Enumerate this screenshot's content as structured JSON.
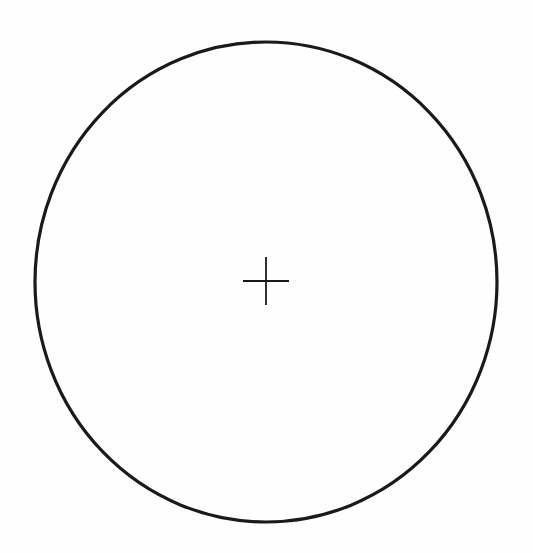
{
  "diagram": {
    "type": "circle-with-center-mark",
    "background_color": "#fefefe",
    "stroke_color": "#1a1a1a",
    "circle": {
      "cx": 266,
      "cy": 282,
      "rx": 231,
      "ry": 240,
      "stroke_width": 3.2
    },
    "center_mark": {
      "cx": 266,
      "cy": 281,
      "half_width": 23,
      "half_height": 24,
      "stroke_width": 1.8
    }
  }
}
